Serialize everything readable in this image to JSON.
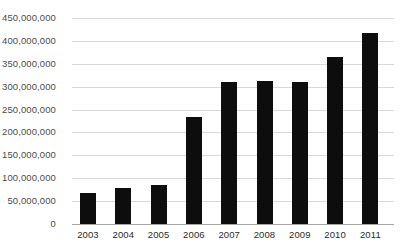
{
  "chart_data": {
    "type": "bar",
    "title": "",
    "subtitle": "",
    "xlabel": "",
    "ylabel": "",
    "categories": [
      "2003",
      "2004",
      "2005",
      "2006",
      "2007",
      "2008",
      "2009",
      "2010",
      "2011"
    ],
    "values": [
      68000000,
      79000000,
      85000000,
      234000000,
      310000000,
      313000000,
      310000000,
      365000000,
      418000000
    ],
    "ylim": [
      0,
      450000000
    ],
    "ytick_values": [
      0,
      50000000,
      100000000,
      150000000,
      200000000,
      250000000,
      300000000,
      350000000,
      400000000,
      450000000
    ],
    "ytick_labels": [
      "0",
      "50,000,000",
      "100,000,000",
      "150,000,000",
      "200,000,000",
      "250,000,000",
      "300,000,000",
      "350,000,000",
      "400,000,000",
      "450,000,000"
    ],
    "grid": true,
    "legend": false,
    "legend_position": "none",
    "bar_color": "#0d0d0d",
    "gridline_color": "#d9d9d9",
    "axis_color": "#a6a6a6",
    "background_color": "#ffffff"
  }
}
